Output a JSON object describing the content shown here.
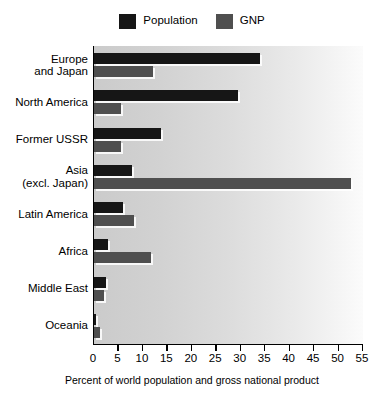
{
  "chart_data": {
    "type": "bar",
    "orientation": "horizontal",
    "title": "",
    "xlabel": "Percent of world population and gross national product",
    "ylabel": "",
    "xlim": [
      0,
      55
    ],
    "xticks": [
      0,
      5,
      10,
      15,
      20,
      25,
      30,
      35,
      40,
      45,
      50,
      55
    ],
    "grid": false,
    "legend_position": "top-center",
    "categories": [
      "Europe\nand Japan",
      "North America",
      "Former USSR",
      "Asia\n(excl. Japan)",
      "Latin America",
      "Africa",
      "Middle East",
      "Oceania"
    ],
    "series": [
      {
        "name": "Population",
        "color": "#161616",
        "values": [
          34.0,
          29.5,
          13.7,
          7.8,
          6.0,
          2.9,
          2.5,
          0.5
        ]
      },
      {
        "name": "GNP",
        "color": "#4f4f4f",
        "values": [
          12.0,
          5.5,
          5.5,
          52.5,
          8.2,
          11.7,
          2.0,
          1.3
        ]
      }
    ]
  },
  "legend": {
    "entries": [
      {
        "label": "Population",
        "color": "#161616"
      },
      {
        "label": "GNP",
        "color": "#4f4f4f"
      }
    ]
  },
  "axis": {
    "x_title": "Percent of world population and gross national product",
    "x_tick_labels": [
      "0",
      "5",
      "10",
      "15",
      "20",
      "25",
      "30",
      "35",
      "40",
      "45",
      "50",
      "55"
    ]
  },
  "category_labels": [
    {
      "line1": "Europe",
      "line2": "and Japan"
    },
    {
      "line1": "North America",
      "line2": ""
    },
    {
      "line1": "Former USSR",
      "line2": ""
    },
    {
      "line1": "Asia",
      "line2": "(excl. Japan)"
    },
    {
      "line1": "Latin America",
      "line2": ""
    },
    {
      "line1": "Africa",
      "line2": ""
    },
    {
      "line1": "Middle East",
      "line2": ""
    },
    {
      "line1": "Oceania",
      "line2": ""
    }
  ]
}
